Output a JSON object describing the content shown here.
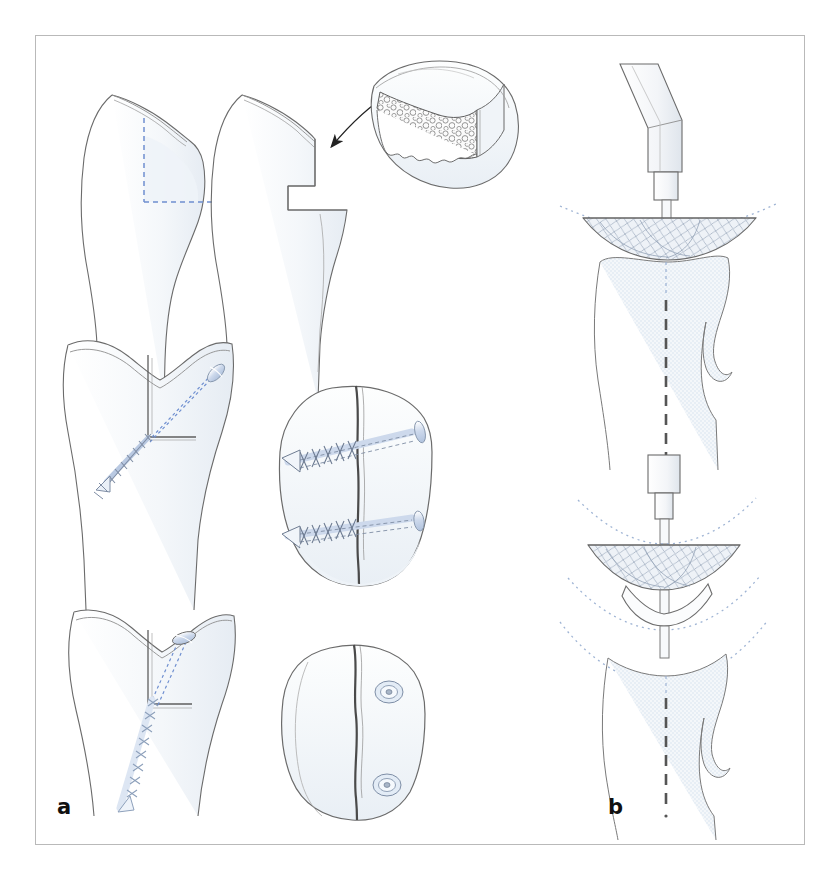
{
  "figure": {
    "background_color": "#ffffff",
    "frame_color": "#b9b9b9",
    "panels": [
      {
        "id": "a",
        "label": "a",
        "caption": "Tibial tubercle osteotomy with bone block elevation and screw fixation",
        "steps": [
          {
            "index": 1,
            "name": "planned-osteotomy",
            "description": "Lateral view of proximal tibia with planned osteotomy outlined in blue dashed lines",
            "view": "lateral"
          },
          {
            "index": 2,
            "name": "osteotomy-performed",
            "description": "Lateral view after the tuberosity fragment has been cut and stepped anteriorly",
            "view": "lateral"
          },
          {
            "index": 3,
            "name": "bone-block-graft",
            "description": "Detached cancellous bone block shown enlarged, with an arrow indicating its origin",
            "view": "detail"
          },
          {
            "index": 4,
            "name": "oblique-screw-fixation-frontal",
            "description": "Frontal view with a single oblique lag screw crossing the osteotomy",
            "view": "frontal"
          },
          {
            "index": 5,
            "name": "two-screw-fixation-axial",
            "description": "Axial view showing two parallel lag screws compressing the fragment",
            "view": "axial"
          },
          {
            "index": 6,
            "name": "long-screw-fixation-frontal",
            "description": "Frontal view with a single long screw directed down the tibial shaft",
            "view": "frontal"
          },
          {
            "index": 7,
            "name": "screw-heads-axial",
            "description": "Axial view showing two countersunk screw heads flush with the cortex",
            "view": "axial"
          }
        ]
      },
      {
        "id": "b",
        "label": "b",
        "caption": "Patellar reaming and thickness reduction using a power reamer",
        "steps": [
          {
            "index": 1,
            "name": "reamer-engaged",
            "description": "Powered reamer with angled handpiece engaging the patellar articular surface",
            "view": "sagittal"
          },
          {
            "index": 2,
            "name": "reaming-depth-planning",
            "description": "Reamer head with dotted arcs indicating successive reaming depths",
            "view": "sagittal"
          },
          {
            "index": 3,
            "name": "resected-wafer",
            "description": "Thin resected bone wafer removed from the patella",
            "view": "sagittal"
          },
          {
            "index": 4,
            "name": "reamed-patella-result",
            "description": "Final reamed patella contour with dashed midline reference axis",
            "view": "sagittal"
          }
        ]
      }
    ],
    "annotations": {
      "osteotomy_guide_color": "#6f8fd0",
      "bone_outline_color": "#5a5a5a",
      "bone_fill_color": "#f2f5f8",
      "screw_color": "#b9c9e2",
      "dotted_arc_color": "#9fb4d4",
      "arrow_color": "#222222"
    }
  }
}
